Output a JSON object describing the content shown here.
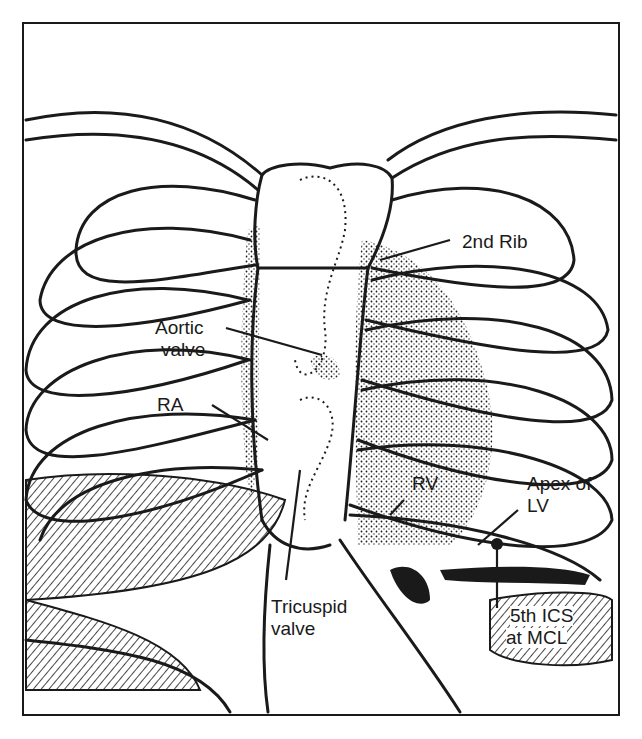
{
  "figure": {
    "labels": {
      "second_rib": "2nd Rib",
      "aortic_valve_line1": "Aortic",
      "aortic_valve_line2": "valve",
      "ra": "RA",
      "rv": "RV",
      "apex_line1": "Apex of",
      "apex_line2": "LV",
      "tricuspid_line1": "Tricuspid",
      "tricuspid_line2": "valve",
      "ics_line1": "5th ICS",
      "ics_line2": "at MCL"
    },
    "colors": {
      "ink": "#1a1a1a",
      "paper": "#ffffff"
    }
  }
}
